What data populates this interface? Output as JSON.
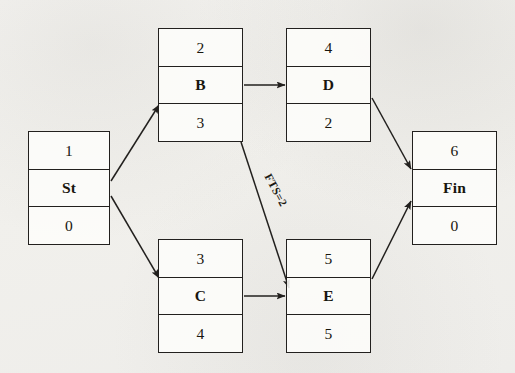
{
  "diagram": {
    "kind": "activity-on-node precedence network",
    "background_color": "#f2f1ee",
    "line_color": "#22201e",
    "nodes": [
      {
        "id": "start",
        "number": "1",
        "name": "St",
        "duration": "0",
        "x": 28,
        "y": 131,
        "w": 82,
        "h": 114
      },
      {
        "id": "b",
        "number": "2",
        "name": "B",
        "duration": "3",
        "x": 158,
        "y": 28,
        "w": 85,
        "h": 114
      },
      {
        "id": "d",
        "number": "4",
        "name": "D",
        "duration": "2",
        "x": 286,
        "y": 28,
        "w": 85,
        "h": 114
      },
      {
        "id": "c",
        "number": "3",
        "name": "C",
        "duration": "4",
        "x": 158,
        "y": 239,
        "w": 85,
        "h": 114
      },
      {
        "id": "e",
        "number": "5",
        "name": "E",
        "duration": "5",
        "x": 286,
        "y": 239,
        "w": 85,
        "h": 114
      },
      {
        "id": "finish",
        "number": "6",
        "name": "Fin",
        "duration": "0",
        "x": 412,
        "y": 131,
        "w": 85,
        "h": 114
      }
    ],
    "edges": [
      {
        "id": "start-b",
        "from": "start",
        "to": "b",
        "label": "",
        "x1": 111,
        "y1": 181,
        "x2": 159,
        "y2": 105
      },
      {
        "id": "start-c",
        "from": "start",
        "to": "c",
        "label": "",
        "x1": 111,
        "y1": 196,
        "x2": 159,
        "y2": 278
      },
      {
        "id": "b-d",
        "from": "b",
        "to": "d",
        "label": "",
        "x1": 244,
        "y1": 85,
        "x2": 285,
        "y2": 85
      },
      {
        "id": "b-e",
        "from": "b",
        "to": "e",
        "label": "FTS=2",
        "x1": 241,
        "y1": 142,
        "x2": 289,
        "y2": 288
      },
      {
        "id": "c-e",
        "from": "c",
        "to": "e",
        "label": "",
        "x1": 244,
        "y1": 296,
        "x2": 285,
        "y2": 296
      },
      {
        "id": "d-finish",
        "from": "d",
        "to": "finish",
        "label": "",
        "x1": 372,
        "y1": 98,
        "x2": 411,
        "y2": 169
      },
      {
        "id": "e-finish",
        "from": "e",
        "to": "finish",
        "label": "",
        "x1": 372,
        "y1": 279,
        "x2": 411,
        "y2": 201
      }
    ],
    "edge_labels": [
      {
        "id": "fts-label",
        "text": "FTS=2",
        "x": 276,
        "y": 190,
        "rotation": 62
      }
    ]
  }
}
